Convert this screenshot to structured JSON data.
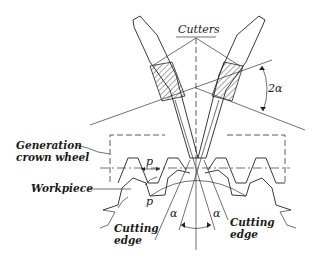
{
  "diagram": {
    "labels": {
      "cutters": "Cutters",
      "angle_top": "2α",
      "generation_line1": "Generation",
      "generation_line2": "crown wheel",
      "pitch_top": "p",
      "workpiece": "Workpiece",
      "pitch_bottom": "p",
      "alpha_left": "α",
      "alpha_right": "α",
      "cutting_edge_left_1": "Cutting",
      "cutting_edge_left_2": "edge",
      "cutting_edge_right_1": "Cutting",
      "cutting_edge_right_2": "edge"
    },
    "colors": {
      "line": "#222222",
      "background": "#ffffff"
    }
  }
}
